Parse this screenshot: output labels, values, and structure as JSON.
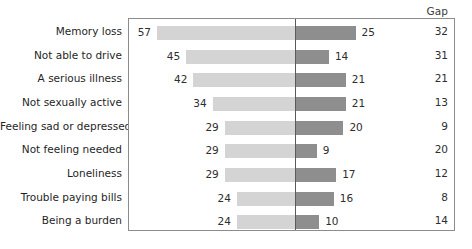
{
  "chart_data": {
    "type": "bar",
    "subtype": "diverging-butterfly",
    "title": "",
    "subtitle": "",
    "xlabel": "",
    "ylabel": "",
    "grid": false,
    "legend_position": "none",
    "center_axis_value": 0,
    "units": "percent",
    "categories": [
      "Memory loss",
      "Not able to drive",
      "A serious illness",
      "Not sexually active",
      "Feeling sad or depressed",
      "Not feeling needed",
      "Loneliness",
      "Trouble paying bills",
      "Being a burden"
    ],
    "series": [
      {
        "name": "left",
        "side": "left",
        "color": "#d4d4d4",
        "values": [
          57,
          45,
          42,
          34,
          29,
          29,
          29,
          24,
          24
        ]
      },
      {
        "name": "right",
        "side": "right",
        "color": "#8e8e8e",
        "values": [
          25,
          14,
          21,
          21,
          20,
          9,
          17,
          16,
          10
        ]
      }
    ],
    "gap_column": {
      "header": "Gap",
      "values": [
        32,
        31,
        21,
        13,
        9,
        20,
        12,
        8,
        14
      ]
    },
    "left_max": 57,
    "right_max": 25,
    "xlim_left": [
      0,
      57
    ],
    "xlim_right": [
      0,
      25
    ],
    "px_per_unit": 2.42
  },
  "colors": {
    "bar_left": "#d4d4d4",
    "bar_right": "#8e8e8e",
    "center_line": "#5a5a5a",
    "box_border": "#8c8c8c",
    "text": "#2e2e2e",
    "background": "#ffffff"
  }
}
